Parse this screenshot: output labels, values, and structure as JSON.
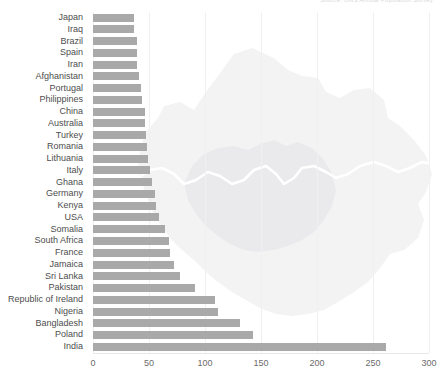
{
  "chart_data": {
    "type": "bar",
    "orientation": "horizontal",
    "title": "Source: ONS Annual Population Survey",
    "xlabel": "",
    "ylabel": "",
    "xlim": [
      0,
      300
    ],
    "xticks": [
      0,
      50,
      100,
      150,
      200,
      250,
      300
    ],
    "xtick_labels": [
      "0",
      "50",
      "100",
      "150",
      "200",
      "250",
      "300"
    ],
    "grid": true,
    "legend": false,
    "bar_color": "#a9a9a9",
    "background_color": "#ffffff",
    "watermark": "greater-london-map",
    "categories": [
      "Japan",
      "Iraq",
      "Brazil",
      "Spain",
      "Iran",
      "Afghanistan",
      "Portugal",
      "Philippines",
      "China",
      "Australia",
      "Turkey",
      "Romania",
      "Lithuania",
      "Italy",
      "Ghana",
      "Germany",
      "Kenya",
      "USA",
      "Somalia",
      "South Africa",
      "France",
      "Jamaica",
      "Sri Lanka",
      "Pakistan",
      "Republic of Ireland",
      "Nigeria",
      "Bangladesh",
      "Poland",
      "India"
    ],
    "values": [
      37,
      37,
      39,
      39,
      39,
      41,
      43,
      44,
      46,
      46,
      47,
      48,
      49,
      51,
      53,
      55,
      56,
      59,
      64,
      68,
      69,
      72,
      78,
      91,
      109,
      112,
      131,
      143,
      262
    ],
    "value_unit": "thousands"
  },
  "axis": {
    "x_tick_labels": [
      "0",
      "50",
      "100",
      "150",
      "200",
      "250",
      "300"
    ]
  }
}
